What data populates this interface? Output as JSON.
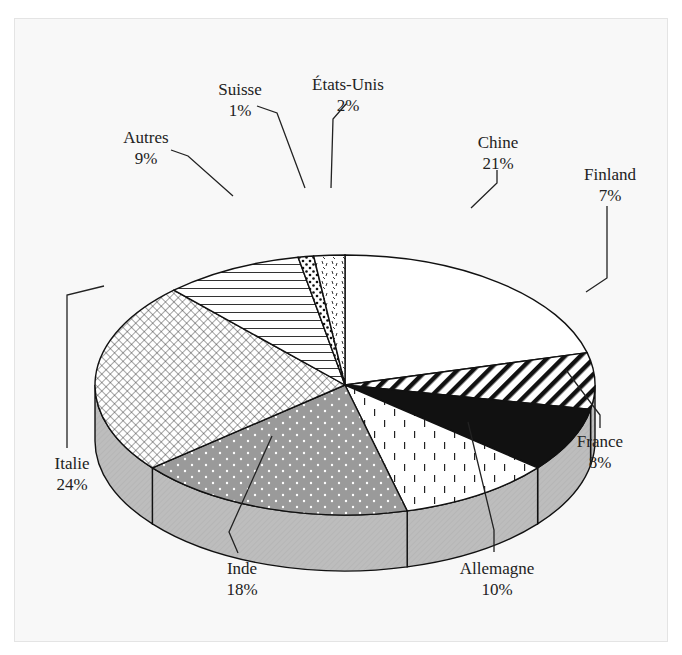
{
  "chart_data": {
    "type": "pie",
    "style": "3d-exploded-hatched",
    "title": "",
    "labels": [
      "Chine",
      "Finland",
      "France",
      "Allemagne",
      "Inde",
      "Italie",
      "Autres",
      "Suisse",
      "États-Unis"
    ],
    "values": [
      21,
      7,
      8,
      10,
      18,
      24,
      9,
      1,
      2
    ],
    "unit": "%",
    "slices": [
      {
        "name": "Chine",
        "value": 21,
        "pct_label": "21%",
        "pattern": "white",
        "label_x": 498,
        "label_y": 148,
        "leader": [
          [
            497,
            170
          ],
          [
            497,
            183
          ],
          [
            471,
            208
          ]
        ]
      },
      {
        "name": "Finland",
        "value": 7,
        "pct_label": "7%",
        "pattern": "diagonal-hatch",
        "label_x": 610,
        "label_y": 180,
        "leader": [
          [
            607,
            206
          ],
          [
            607,
            278
          ],
          [
            586,
            292
          ]
        ]
      },
      {
        "name": "France",
        "value": 8,
        "pct_label": "8%",
        "pattern": "solid-black",
        "label_x": 600,
        "label_y": 447,
        "leader": [
          [
            600,
            428
          ],
          [
            600,
            415
          ],
          [
            566,
            370
          ]
        ]
      },
      {
        "name": "Allemagne",
        "value": 10,
        "pct_label": "10%",
        "pattern": "vertical-dashes",
        "label_x": 497,
        "label_y": 574,
        "leader": [
          [
            494,
            552
          ],
          [
            494,
            530
          ],
          [
            468,
            422
          ]
        ]
      },
      {
        "name": "Inde",
        "value": 18,
        "pct_label": "18%",
        "pattern": "gray-dots",
        "label_x": 242,
        "label_y": 574,
        "leader": [
          [
            238,
            553
          ],
          [
            229,
            532
          ],
          [
            272,
            436
          ]
        ]
      },
      {
        "name": "Italie",
        "value": 24,
        "pct_label": "24%",
        "pattern": "crosshatch",
        "label_x": 72,
        "label_y": 469,
        "leader": [
          [
            67,
            448
          ],
          [
            67,
            295
          ],
          [
            104,
            286
          ]
        ]
      },
      {
        "name": "Autres",
        "value": 9,
        "pct_label": "9%",
        "pattern": "horizontal-lines",
        "label_x": 146,
        "label_y": 143,
        "leader": [
          [
            171,
            150
          ],
          [
            188,
            156
          ],
          [
            233,
            196
          ]
        ]
      },
      {
        "name": "Suisse",
        "value": 1,
        "pct_label": "1%",
        "pattern": "dots",
        "label_x": 240,
        "label_y": 95,
        "leader": [
          [
            257,
            106
          ],
          [
            277,
            113
          ],
          [
            305,
            188
          ]
        ]
      },
      {
        "name": "États-Unis",
        "value": 2,
        "pct_label": "2%",
        "pattern": "speckle",
        "label_x": 348,
        "label_y": 90,
        "leader": [
          [
            346,
            104
          ],
          [
            333,
            119
          ],
          [
            331,
            188
          ]
        ]
      }
    ]
  }
}
